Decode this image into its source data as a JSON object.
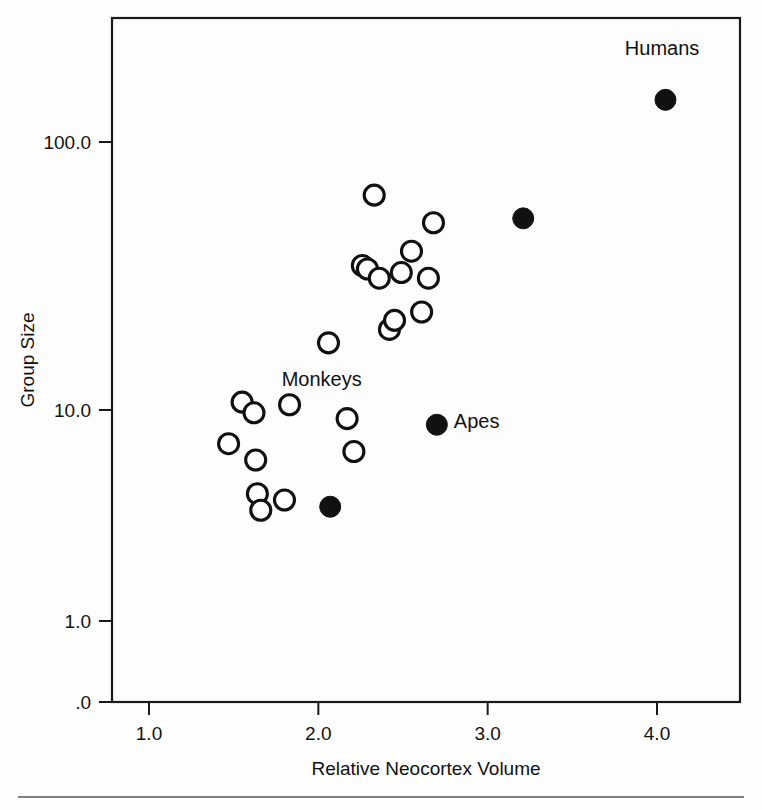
{
  "figure": {
    "title": "",
    "background": "#fdfdfd",
    "frame_color": "#1a1a1a"
  },
  "axes": {
    "x_title": "Relative Neocortex Volume",
    "y_title": "Group Size",
    "x_ticks": [
      "1.0",
      "2.0",
      "3.0",
      "4.0"
    ],
    "y_ticks": [
      "100.0",
      "10.0",
      "1.0",
      ".0"
    ]
  },
  "annotations": {
    "humans": "Humans",
    "apes": "Apes",
    "monkeys": "Monkeys"
  },
  "chart_data": {
    "type": "scatter",
    "title": "",
    "xlabel": "Relative Neocortex Volume",
    "ylabel": "Group Size",
    "xlim": [
      0.6,
      4.5
    ],
    "ylim": [
      0.25,
      300
    ],
    "yscale": "log",
    "xscale": "linear",
    "grid": false,
    "legend": null,
    "xticks": [
      1.0,
      2.0,
      3.0,
      4.0
    ],
    "xticklabels": [
      "1.0",
      "2.0",
      "3.0",
      "4.0"
    ],
    "yticks": [
      100.0,
      10.0,
      1.0,
      0.25
    ],
    "yticklabels": [
      "100.0",
      "10.0",
      "1.0",
      ".0"
    ],
    "series": [
      {
        "name": "Monkeys",
        "marker": "open-circle",
        "color": "#fdfdfd",
        "edge_color": "#101010",
        "points": [
          {
            "x": 1.47,
            "y": 5.5
          },
          {
            "x": 1.55,
            "y": 8.2
          },
          {
            "x": 1.62,
            "y": 7.4
          },
          {
            "x": 1.63,
            "y": 4.7
          },
          {
            "x": 1.64,
            "y": 3.4
          },
          {
            "x": 1.66,
            "y": 2.9
          },
          {
            "x": 1.8,
            "y": 3.2
          },
          {
            "x": 1.83,
            "y": 8.0
          },
          {
            "x": 2.06,
            "y": 14.5
          },
          {
            "x": 2.17,
            "y": 7.0
          },
          {
            "x": 2.21,
            "y": 5.1
          },
          {
            "x": 2.26,
            "y": 30.5
          },
          {
            "x": 2.29,
            "y": 29.5
          },
          {
            "x": 2.33,
            "y": 60.0
          },
          {
            "x": 2.36,
            "y": 27.0
          },
          {
            "x": 2.42,
            "y": 16.5
          },
          {
            "x": 2.45,
            "y": 18.0
          },
          {
            "x": 2.49,
            "y": 28.5
          },
          {
            "x": 2.55,
            "y": 35.0
          },
          {
            "x": 2.61,
            "y": 19.5
          },
          {
            "x": 2.65,
            "y": 27.0
          },
          {
            "x": 2.68,
            "y": 46.0
          }
        ]
      },
      {
        "name": "Apes",
        "marker": "filled-circle",
        "color": "#111111",
        "edge_color": "#111111",
        "points": [
          {
            "x": 2.07,
            "y": 3.0
          },
          {
            "x": 2.7,
            "y": 6.6
          },
          {
            "x": 3.21,
            "y": 48.0
          }
        ]
      },
      {
        "name": "Humans",
        "marker": "filled-circle",
        "color": "#111111",
        "edge_color": "#111111",
        "points": [
          {
            "x": 4.05,
            "y": 150.0
          }
        ]
      }
    ],
    "annotations": [
      {
        "text": "Humans",
        "x": 4.03,
        "y": 230.0
      },
      {
        "text": "Apes",
        "x": 2.8,
        "y": 6.4
      },
      {
        "text": "Monkeys",
        "x": 2.02,
        "y": 9.6
      }
    ]
  }
}
